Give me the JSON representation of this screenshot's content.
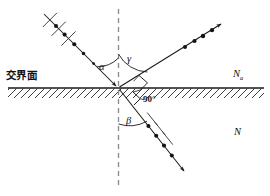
{
  "figure": {
    "kind": "optics-ray-diagram",
    "title_text": "",
    "background_color": "#ffffff",
    "stroke_color": "#1a1a1a",
    "width": 270,
    "height": 196
  },
  "labels": {
    "interface": "交界面",
    "angle_incidence": "α",
    "angle_reflection": "γ",
    "angle_refraction": "β",
    "right_angle": "90°",
    "medium_upper": "N",
    "medium_upper_sub": "a",
    "medium_lower": "N"
  },
  "geometry": {
    "origin": {
      "x": 118,
      "y": 88
    },
    "interface_line": {
      "x1": 8,
      "y1": 88,
      "x2": 264,
      "y2": 88
    },
    "normal_line": {
      "x1": 118,
      "y1": 10,
      "x2": 118,
      "y2": 188,
      "style": "dashed"
    },
    "hatch_side": "below",
    "rays": [
      {
        "name": "incident-ray",
        "from": {
          "x": 44,
          "y": 14
        },
        "to": {
          "x": 118,
          "y": 88
        },
        "arrow_at": "end",
        "dot_count": 5,
        "tick_count": 3,
        "angle_from_normal_deg": 45
      },
      {
        "name": "reflected-ray",
        "from": {
          "x": 118,
          "y": 88
        },
        "to": {
          "x": 222,
          "y": 23
        },
        "arrow_at": "end",
        "dot_count": 4,
        "tick_count": 0,
        "angle_from_normal_deg": 58
      },
      {
        "name": "refracted-ray",
        "from": {
          "x": 118,
          "y": 88
        },
        "to": {
          "x": 185,
          "y": 172
        },
        "arrow_at": "end",
        "dot_count": 4,
        "tick_count": 3,
        "angle_from_normal_deg": 38
      }
    ],
    "arcs": [
      {
        "name": "alpha-arc",
        "label": "α"
      },
      {
        "name": "gamma-arc",
        "label": "γ"
      },
      {
        "name": "beta-arc",
        "label": "β"
      },
      {
        "name": "right-angle-marks",
        "label": "90°"
      }
    ]
  }
}
